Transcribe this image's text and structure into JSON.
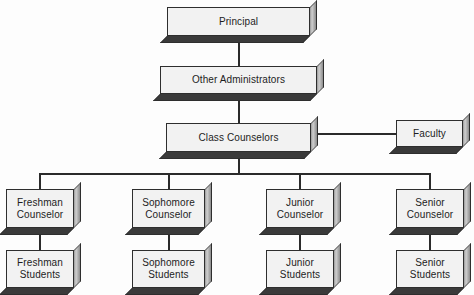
{
  "diagram": {
    "type": "organizational-chart",
    "background_color": "#fdfdfd",
    "box_fill_color": "#f2f2f2",
    "box_border_color": "#2e2e2e",
    "connector_color": "#2b2b2b",
    "extrusion_shadow_color": "#3a3a3a"
  },
  "nodes": {
    "principal": {
      "label": "Principal",
      "level": 1
    },
    "other_administrators": {
      "label": "Other Administrators",
      "level": 2
    },
    "class_counselors": {
      "label": "Class Counselors",
      "level": 3
    },
    "faculty": {
      "label": "Faculty",
      "level": 3
    },
    "freshman_counselor": {
      "label": "Freshman\nCounselor",
      "level": 4
    },
    "sophomore_counselor": {
      "label": "Sophomore\nCounselor",
      "level": 4
    },
    "junior_counselor": {
      "label": "Junior\nCounselor",
      "level": 4
    },
    "senior_counselor": {
      "label": "Senior\nCounselor",
      "level": 4
    },
    "freshman_students": {
      "label": "Freshman\nStudents",
      "level": 5
    },
    "sophomore_students": {
      "label": "Sophomore\nStudents",
      "level": 5
    },
    "junior_students": {
      "label": "Junior\nStudents",
      "level": 5
    },
    "senior_students": {
      "label": "Senior\nStudents",
      "level": 5
    }
  },
  "edges": [
    {
      "from": "principal",
      "to": "other_administrators",
      "orientation": "vertical"
    },
    {
      "from": "other_administrators",
      "to": "class_counselors",
      "orientation": "vertical"
    },
    {
      "from": "class_counselors",
      "to": "faculty",
      "orientation": "horizontal"
    },
    {
      "from": "class_counselors",
      "to": "freshman_counselor",
      "orientation": "vertical-bus"
    },
    {
      "from": "class_counselors",
      "to": "sophomore_counselor",
      "orientation": "vertical-bus"
    },
    {
      "from": "class_counselors",
      "to": "junior_counselor",
      "orientation": "vertical-bus"
    },
    {
      "from": "class_counselors",
      "to": "senior_counselor",
      "orientation": "vertical-bus"
    },
    {
      "from": "freshman_counselor",
      "to": "freshman_students",
      "orientation": "vertical"
    },
    {
      "from": "sophomore_counselor",
      "to": "sophomore_students",
      "orientation": "vertical"
    },
    {
      "from": "junior_counselor",
      "to": "junior_students",
      "orientation": "vertical"
    },
    {
      "from": "senior_counselor",
      "to": "senior_students",
      "orientation": "vertical"
    }
  ]
}
